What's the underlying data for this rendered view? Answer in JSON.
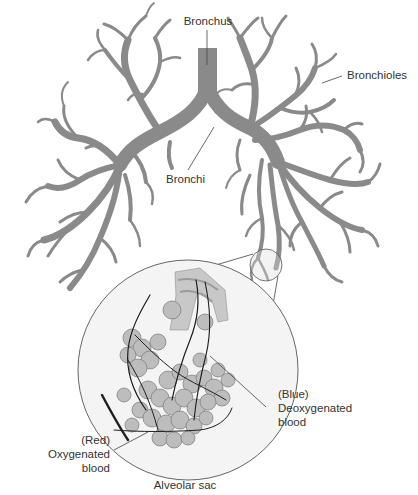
{
  "diagram": {
    "colors": {
      "airway": "#8a8a8a",
      "leader_line": "#444444",
      "inset_fill": "#f2f2f2",
      "alveoli": "#b5b5b5",
      "vessels": "#1e1e1e",
      "text": "#333333"
    },
    "labels": {
      "bronchus": "Bronchus",
      "bronchioles": "Bronchioles",
      "bronchi": "Bronchi",
      "deoxygenated": {
        "line1": "(Blue)",
        "line2": "Deoxygenated",
        "line3": "blood"
      },
      "oxygenated": {
        "line1": "(Red)",
        "line2": "Oxygenated",
        "line3": "blood"
      },
      "alveolar_sac": "Alveolar sac"
    }
  }
}
